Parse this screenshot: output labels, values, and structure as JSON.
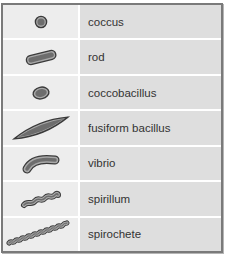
{
  "table": {
    "rows": [
      {
        "shape": "coccus-icon",
        "label": "coccus"
      },
      {
        "shape": "rod-icon",
        "label": "rod"
      },
      {
        "shape": "coccobacillus-icon",
        "label": "coccobacillus"
      },
      {
        "shape": "fusiform-bacillus-icon",
        "label": "fusiform bacillus"
      },
      {
        "shape": "vibrio-icon",
        "label": "vibrio"
      },
      {
        "shape": "spirillum-icon",
        "label": "spirillum"
      },
      {
        "shape": "spirochete-icon",
        "label": "spirochete"
      }
    ]
  },
  "colors": {
    "cell_fill": "#6d6d6d",
    "cell_outline": "#3a3a3a",
    "cell_rim": "#a8a8a8",
    "left_column_bg": "#ededed",
    "right_column_bg": "#dedede",
    "frame_border": "#7a7a7a"
  }
}
